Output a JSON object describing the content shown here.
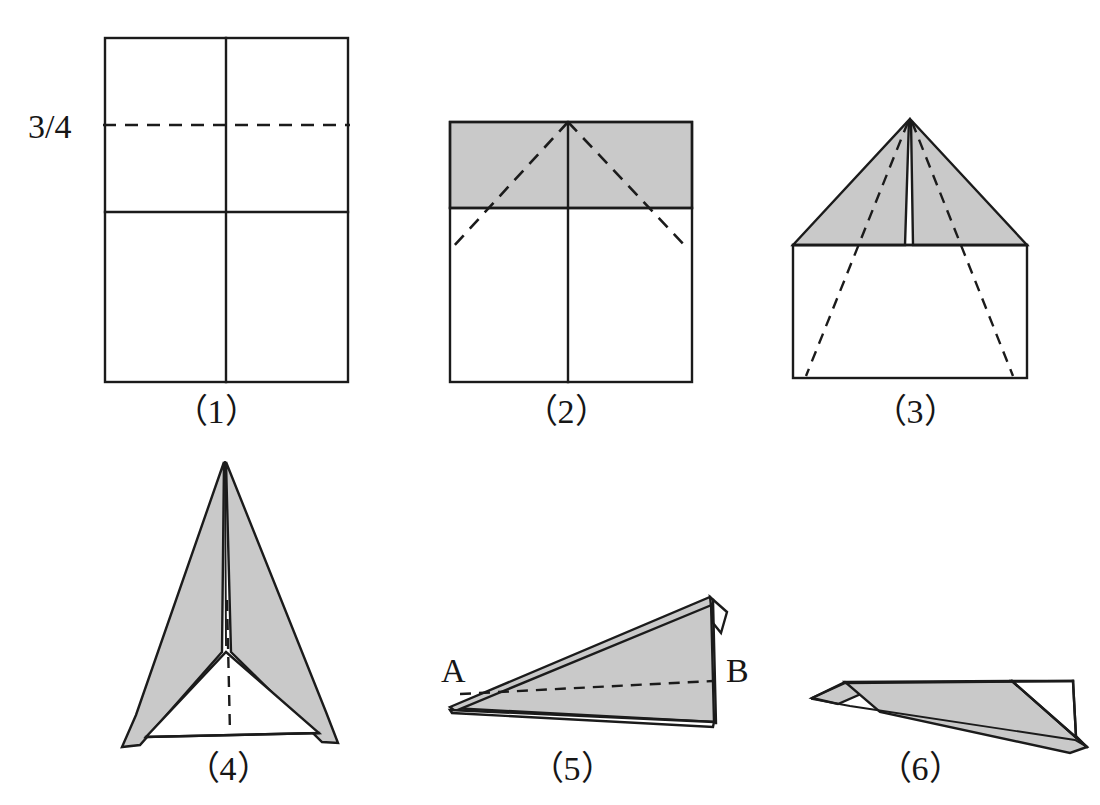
{
  "sheet": {
    "title": "Paper airplane folding sequence",
    "background_color": "#ffffff",
    "ink_color": "#1b1b1b",
    "shade_color": "#c9c9c9"
  },
  "annotations": {
    "fraction_label": "3/4",
    "point_a_label": "A",
    "point_b_label": "B"
  },
  "captions": {
    "step1": "（1）",
    "step2": "（2）",
    "step3": "（3）",
    "step4": "（4）",
    "step5": "（5）",
    "step6": "（6）"
  },
  "steps": [
    {
      "id": 1,
      "caption": "（1）",
      "description": "Rectangular sheet with solid vertical centre crease, solid horizontal half crease and dashed 3/4 crease line",
      "shaded": false,
      "labels": [
        "3/4"
      ]
    },
    {
      "id": 2,
      "caption": "（2）",
      "description": "Top quarter band shaded; dashed diagonals from top centre point down to the sides",
      "shaded": true,
      "labels": []
    },
    {
      "id": 3,
      "caption": "（3）",
      "description": "Two shaded triangular wings folded to a point at the top, narrow white notch at the centre, dashed diagonals running to the bottom corners",
      "shaded": true,
      "labels": []
    },
    {
      "id": 4,
      "caption": "（4）",
      "description": "Shaded arrow/dart shape with two long wings, dashed centre line",
      "shaded": true,
      "labels": []
    },
    {
      "id": 5,
      "caption": "（5）",
      "description": "Side view of folded dart, nose at A on the left and tail at B on the right, dashed fold line",
      "shaded": true,
      "labels": [
        "A",
        "B"
      ]
    },
    {
      "id": 6,
      "caption": "（6）",
      "description": "Finished paper airplane seen from the side with wing folded down",
      "shaded": true,
      "labels": []
    }
  ]
}
